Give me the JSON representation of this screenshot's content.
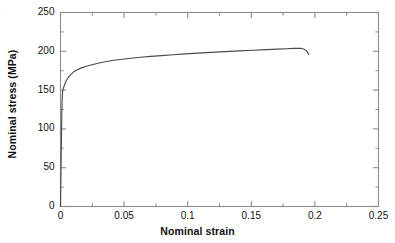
{
  "chart_data": {
    "type": "line",
    "title": "",
    "xlabel": "Nominal strain",
    "ylabel": "Nominal stress (MPa)",
    "xlim": [
      0,
      0.25
    ],
    "ylim": [
      0,
      250
    ],
    "xticks": [
      "0",
      "0.05",
      "0.1",
      "0.15",
      "0.2",
      "0.25"
    ],
    "xtick_values": [
      0,
      0.05,
      0.1,
      0.15,
      0.2,
      0.25
    ],
    "yticks": [
      "0",
      "50",
      "100",
      "150",
      "200",
      "250"
    ],
    "ytick_values": [
      0,
      50,
      100,
      150,
      200,
      250
    ],
    "grid": false,
    "legend": "none",
    "minor_ticks": true,
    "tick_direction": "in",
    "line_color": "#4a4a4a",
    "frame_color": "#8c8c8c",
    "series": [
      {
        "name": "Nominal stress-strain curve",
        "x": [
          0,
          0.0002,
          0.0005,
          0.0008,
          0.0011,
          0.0014,
          0.0017,
          0.002,
          0.0026,
          0.0034,
          0.0045,
          0.006,
          0.008,
          0.0105,
          0.0135,
          0.017,
          0.021,
          0.0255,
          0.0305,
          0.036,
          0.042,
          0.0485,
          0.0555,
          0.063,
          0.071,
          0.0795,
          0.0885,
          0.098,
          0.108,
          0.1185,
          0.1295,
          0.1405,
          0.1515,
          0.162,
          0.171,
          0.178,
          0.1835,
          0.187,
          0.189,
          0.1905,
          0.192,
          0.1935,
          0.1945,
          0.1952
        ],
        "y": [
          0,
          26,
          62,
          97,
          125,
          142,
          149,
          151,
          154,
          158,
          162,
          166,
          170,
          173.5,
          176.5,
          179,
          181,
          183,
          185,
          186.8,
          188.4,
          189.8,
          191.1,
          192.3,
          193.4,
          194.5,
          195.6,
          196.6,
          197.6,
          198.6,
          199.6,
          200.5,
          201.4,
          202.2,
          202.8,
          203.3,
          203.7,
          203.9,
          203.8,
          203.3,
          202.2,
          200.2,
          198.0,
          196.0
        ]
      }
    ],
    "annotations": {
      "yield_stress_mpa": 150,
      "ultimate_tensile_stress_mpa": 204,
      "strain_at_uts": 0.188,
      "fracture_strain": 0.195,
      "fracture_stress_mpa": 196
    }
  },
  "artifact": {
    "corner_mark": "."
  }
}
